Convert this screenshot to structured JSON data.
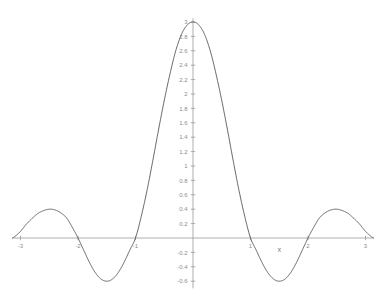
{
  "chart_data": {
    "type": "line",
    "title": "",
    "subtitle": "",
    "xlabel": "x",
    "ylabel": "",
    "xlim": [
      -3.14159,
      3.14159
    ],
    "ylim": [
      -0.7,
      3.05
    ],
    "grid": false,
    "legend": null,
    "x_ticks": [
      -3,
      -2,
      -1,
      1,
      2,
      3
    ],
    "x_tick_labels": [
      "-3",
      "-2",
      "-1",
      "1",
      "2",
      "3"
    ],
    "y_ticks": [
      -0.6,
      -0.4,
      -0.2,
      0.2,
      0.4,
      0.6,
      0.8,
      1,
      1.2,
      1.4,
      1.6,
      1.8,
      2,
      2.2,
      2.4,
      2.6,
      2.8,
      3
    ],
    "y_tick_labels": [
      "-0.6",
      "-0.4",
      "-0.2",
      "0.2",
      "0.4",
      "0.6",
      "0.8",
      "1",
      "1.2",
      "1.4",
      "1.6",
      "1.8",
      "2",
      "2.2",
      "2.4",
      "2.6",
      "2.8",
      "3"
    ],
    "series": [
      {
        "name": "curve",
        "color": "#55555a",
        "x": [
          -3.14159,
          -3.0,
          -2.9,
          -2.8,
          -2.7,
          -2.6,
          -2.5,
          -2.4,
          -2.3,
          -2.2,
          -2.1,
          -2.0,
          -1.9,
          -1.8,
          -1.7,
          -1.6,
          -1.5,
          -1.4,
          -1.3,
          -1.2,
          -1.1,
          -1.0,
          -0.9,
          -0.8,
          -0.7,
          -0.6,
          -0.5,
          -0.4,
          -0.3,
          -0.2,
          -0.1,
          0.0,
          0.1,
          0.2,
          0.3,
          0.4,
          0.5,
          0.6,
          0.7,
          0.8,
          0.9,
          1.0,
          1.1,
          1.2,
          1.3,
          1.4,
          1.5,
          1.6,
          1.7,
          1.8,
          1.9,
          2.0,
          2.1,
          2.2,
          2.3,
          2.4,
          2.5,
          2.6,
          2.7,
          2.8,
          2.9,
          3.0,
          3.14159
        ],
        "y": [
          0.0,
          0.09,
          0.19,
          0.27,
          0.34,
          0.38,
          0.4,
          0.39,
          0.35,
          0.28,
          0.15,
          0.0,
          -0.17,
          -0.34,
          -0.48,
          -0.57,
          -0.6,
          -0.57,
          -0.48,
          -0.34,
          -0.17,
          0.0,
          0.3,
          0.66,
          1.07,
          1.5,
          1.91,
          2.28,
          2.6,
          2.83,
          2.96,
          3.0,
          2.96,
          2.83,
          2.6,
          2.28,
          1.91,
          1.5,
          1.07,
          0.66,
          0.3,
          0.0,
          -0.17,
          -0.34,
          -0.48,
          -0.57,
          -0.6,
          -0.57,
          -0.48,
          -0.34,
          -0.17,
          0.0,
          0.15,
          0.28,
          0.35,
          0.39,
          0.4,
          0.38,
          0.34,
          0.27,
          0.19,
          0.09,
          0.0
        ]
      }
    ],
    "annotations": []
  },
  "axis": {
    "x_name": "x",
    "y_name": ""
  },
  "style": {
    "background": "#ffffff",
    "axis_color": "#9a9a9a",
    "tick_label_color": "#8c8c8c",
    "curve_color": "#55555a"
  }
}
